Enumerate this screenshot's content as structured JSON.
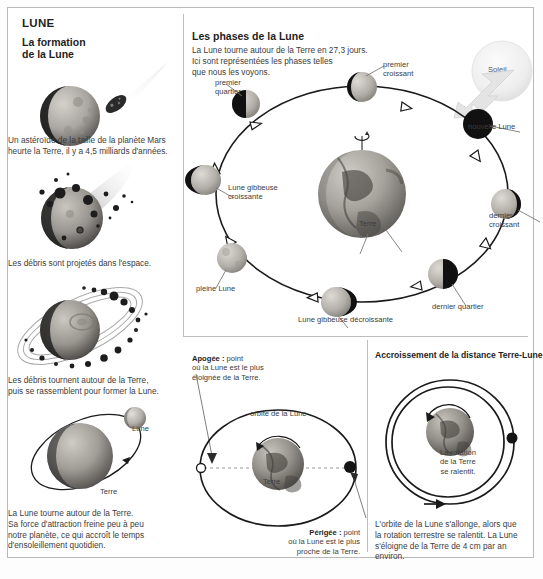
{
  "title": "LUNE",
  "left_column": {
    "heading": "La formation\nde la Lune",
    "heading_line1": "La formation",
    "heading_line2": "de la Lune",
    "steps": [
      {
        "id": "impact",
        "caption": "Un astéroïde de la taille de la planète Mars\nheurte la Terre, il y a 4,5 milliards d'années.",
        "caption_line1": "Un astéroïde de la taille de la planète Mars",
        "caption_line2": "heurte la Terre, il y a 4,5 milliards d'années."
      },
      {
        "id": "debris-ejected",
        "caption": "Les débris sont projetés dans l'espace.",
        "caption_line1": "Les débris sont projetés dans l'espace.",
        "caption_line2": ""
      },
      {
        "id": "debris-ring",
        "caption": "Les débris tournent autour de la Terre,\npuis se rassemblent pour former la Lune.",
        "caption_line1": "Les débris tournent autour de la Terre,",
        "caption_line2": "puis se rassemblent pour former la Lune."
      },
      {
        "id": "moon-orbit",
        "caption": "La Lune tourne autour de la Terre.\nSa force d'attraction freine peu à peu\nnotre planète, ce qui accroît le temps\nd'ensoleillement quotidien.",
        "caption_line1": "La Lune tourne autour de la Terre.",
        "caption_line2": "Sa force d'attraction freine peu à peu",
        "caption_line3": "notre planète, ce qui accroît le temps",
        "caption_line4": "d'ensoleillement quotidien.",
        "label_moon": "Lune",
        "label_earth": "Terre"
      }
    ]
  },
  "phases_panel": {
    "heading": "Les phases de la Lune",
    "intro_line1": "La Lune tourne autour de la Terre en 27,3 jours.",
    "intro_line2": "Ici sont représentées les phases telles",
    "intro_line3": "que nous les voyons.",
    "sun_label": "Soleil",
    "earth_label": "Terre",
    "phases": [
      {
        "name": "premier quartier",
        "line1": "premier",
        "line2": "quartier"
      },
      {
        "name": "premier croissant",
        "line1": "premier",
        "line2": "croissant"
      },
      {
        "name": "nouvelle Lune",
        "line1": "nouvelle Lune",
        "line2": ""
      },
      {
        "name": "dernier croissant",
        "line1": "dernier",
        "line2": "croissant"
      },
      {
        "name": "dernier quartier",
        "line1": "dernier quartier",
        "line2": ""
      },
      {
        "name": "Lune gibbeuse décroissante",
        "line1": "Lune gibbeuse décroissante",
        "line2": ""
      },
      {
        "name": "pleine Lune",
        "line1": "pleine Lune",
        "line2": ""
      },
      {
        "name": "Lune gibbeuse croissante",
        "line1": "Lune gibbeuse",
        "line2": "croissante"
      }
    ]
  },
  "apogee_panel": {
    "apogee_label_bold": "Apogée :",
    "apogee_line1_rest": " point",
    "apogee_line2": "où la Lune est le plus",
    "apogee_line3": "éloignée de la Terre.",
    "orbit_label": "orbite de la Lune",
    "earth_label": "Terre",
    "perigee_label_bold": "Périgée :",
    "perigee_line1_rest": " point",
    "perigee_line2": "où la Lune est le plus",
    "perigee_line3": "proche de la Terre."
  },
  "distance_panel": {
    "heading": "Accroissement de la distance Terre-Lune",
    "rotation_line1": "La rotation",
    "rotation_line2": "de la Terre",
    "rotation_line3": "se ralentit.",
    "caption_line1": "L'orbite de la Lune s'allonge, alors que",
    "caption_line2": "la rotation terrestre se ralentit. La Lune",
    "caption_line3": "s'éloigne de la Terre de 4 cm par an environ."
  },
  "colors": {
    "frame": "#b9b9b9",
    "divider": "#bdbdbd",
    "text": "#3c3c3c",
    "heading": "#1e1e1e",
    "moon_lit": "#b0aca6",
    "moon_dark": "#141414",
    "earth_dark": "#5b5b58",
    "line": "#1a1a1a"
  }
}
